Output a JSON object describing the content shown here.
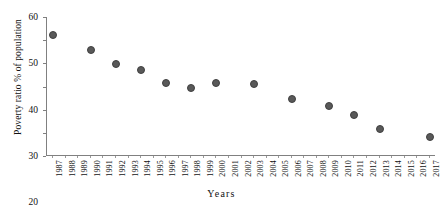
{
  "chart_data": {
    "type": "scatter",
    "title": "",
    "xlabel": "Years",
    "ylabel": "Poverty ratio % of population",
    "xlim": [
      1986.5,
      2017.5
    ],
    "ylim": [
      0,
      60
    ],
    "grid": false,
    "legend": null,
    "marker_color": "#595959",
    "axis_color": "#808080",
    "yticks": [
      0,
      10,
      20,
      30,
      40,
      50,
      60
    ],
    "ytick_labels": [
      "0",
      "10",
      "20",
      "30",
      "40",
      "50",
      "60"
    ],
    "categories": [
      "1987",
      "1988",
      "1989",
      "1990",
      "1991",
      "1992",
      "1993",
      "1994",
      "1995",
      "1996",
      "1997",
      "1998",
      "1999",
      "2000",
      "2001",
      "2002",
      "2003",
      "2004",
      "2005",
      "2006",
      "2007",
      "2008",
      "2009",
      "2010",
      "2011",
      "2012",
      "2013",
      "2014",
      "2015",
      "2016",
      "2017"
    ],
    "points": [
      {
        "x": "1987",
        "y": 52.5
      },
      {
        "x": "1990",
        "y": 46.3
      },
      {
        "x": "1992",
        "y": 40.2
      },
      {
        "x": "1994",
        "y": 37.5
      },
      {
        "x": "1996",
        "y": 32.0
      },
      {
        "x": "1998",
        "y": 30.0
      },
      {
        "x": "2000",
        "y": 32.0
      },
      {
        "x": "2003",
        "y": 31.5
      },
      {
        "x": "2006",
        "y": 25.0
      },
      {
        "x": "2009",
        "y": 22.0
      },
      {
        "x": "2011",
        "y": 18.0
      },
      {
        "x": "2013",
        "y": 12.0
      },
      {
        "x": "2017",
        "y": 8.7
      }
    ]
  }
}
